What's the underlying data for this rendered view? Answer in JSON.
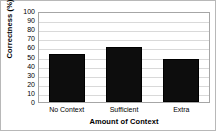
{
  "chart_data": {
    "type": "bar",
    "title": "",
    "categories": [
      "No Context",
      "Sufficient",
      "Extra"
    ],
    "values": [
      53,
      60,
      47
    ],
    "series": [
      {
        "name": "Correctness",
        "values": [
          53,
          60,
          47
        ]
      }
    ],
    "xlabel": "Amount of Context",
    "ylabel": "Correctness (%)",
    "ylim": [
      0,
      100
    ],
    "ytick_labels": [
      "100",
      "90",
      "80",
      "70",
      "60",
      "50",
      "40",
      "30",
      "20",
      "10",
      "0"
    ],
    "ytick_values": [
      100,
      90,
      80,
      70,
      60,
      50,
      40,
      30,
      20,
      10,
      0
    ],
    "grid": true,
    "grid_axis": "y",
    "legend": "none",
    "bar_color": "#0d0d0d",
    "grid_color": "#d9d9d9",
    "axis_color": "#a6a6a6",
    "border_color": "#b8b8b8",
    "text_color": "#000000"
  }
}
